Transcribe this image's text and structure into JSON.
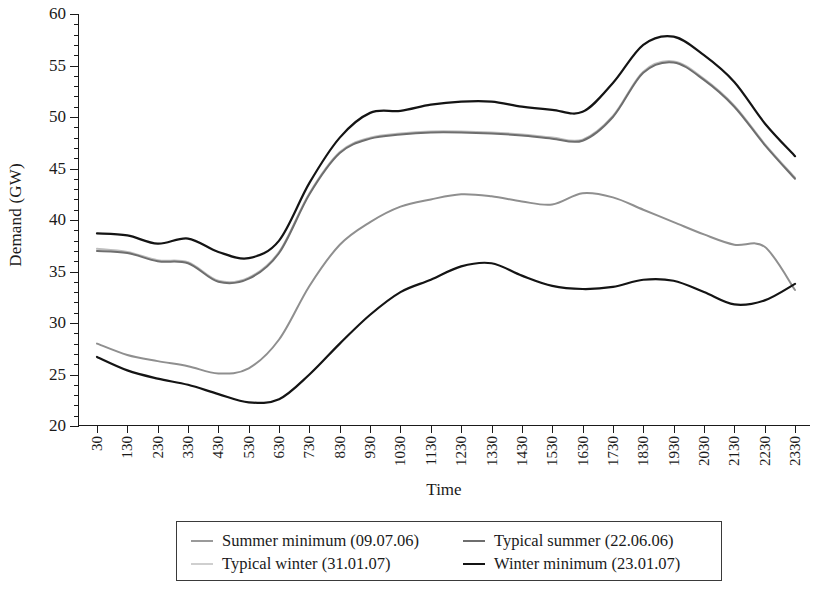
{
  "chart_data": {
    "type": "line",
    "title": "",
    "xlabel": "Time",
    "ylabel": "Demand (GW)",
    "ylim": [
      20,
      60
    ],
    "ytick_step": 5,
    "yminor_step": 1,
    "grid": false,
    "legend_position": "bottom",
    "yticks": [
      20,
      25,
      30,
      35,
      40,
      45,
      50,
      55,
      60
    ],
    "categories": [
      "30",
      "130",
      "230",
      "330",
      "430",
      "530",
      "630",
      "730",
      "830",
      "930",
      "1030",
      "1130",
      "1230",
      "1330",
      "1430",
      "1530",
      "1630",
      "1730",
      "1830",
      "1930",
      "2030",
      "2130",
      "2230",
      "2330"
    ],
    "series": [
      {
        "name": "Summer minimum (09.07.06)",
        "color": "#9a9a9a",
        "width": 2.0,
        "values": [
          28.0,
          26.9,
          26.3,
          25.8,
          25.1,
          25.6,
          28.4,
          33.6,
          37.6,
          39.8,
          41.3,
          42.0,
          42.5,
          42.3,
          41.8,
          41.5,
          42.6,
          42.2,
          41.0,
          39.8,
          38.6,
          37.6,
          37.4,
          33.2
        ]
      },
      {
        "name": "Typical summer (22.06.06)",
        "color": "#6e6e6e",
        "width": 2.0,
        "values": [
          37.0,
          36.8,
          36.0,
          35.8,
          34.0,
          34.3,
          36.8,
          42.5,
          46.5,
          47.9,
          48.3,
          48.5,
          48.5,
          48.4,
          48.2,
          47.9,
          47.7,
          50.0,
          54.3,
          55.3,
          53.6,
          51.0,
          47.3,
          44.0
        ]
      },
      {
        "name": "Typical winter (31.01.07)",
        "color": "#bdbdbd",
        "width": 2.0,
        "values": [
          37.2,
          36.9,
          36.1,
          35.9,
          34.1,
          34.4,
          36.9,
          42.6,
          46.6,
          48.0,
          48.4,
          48.6,
          48.6,
          48.5,
          48.3,
          48.0,
          47.8,
          50.1,
          54.4,
          55.4,
          53.7,
          51.1,
          47.4,
          44.1
        ]
      },
      {
        "name": "Winter minimum (23.01.07)",
        "color": "#141414",
        "width": 2.2,
        "values": [
          26.7,
          25.4,
          24.6,
          24.0,
          23.1,
          22.3,
          22.6,
          25.0,
          28.0,
          30.8,
          33.0,
          34.2,
          35.5,
          35.8,
          34.6,
          33.6,
          33.3,
          33.5,
          34.2,
          34.1,
          33.0,
          31.8,
          32.2,
          33.8
        ]
      }
    ],
    "upper_black": {
      "name": "winter-minimum-upper-trace",
      "color": "#141414",
      "width": 2.2,
      "values": [
        38.7,
        38.5,
        37.7,
        38.2,
        36.9,
        36.3,
        38.0,
        43.6,
        48.0,
        50.4,
        50.6,
        51.2,
        51.5,
        51.5,
        51.0,
        50.7,
        50.5,
        53.3,
        57.0,
        57.8,
        56.0,
        53.4,
        49.4,
        46.2
      ]
    },
    "lower_gray": {
      "name": "summer-minimum-lower-trace",
      "color": "#8f8f8f",
      "width": 2.0,
      "values": [
        28.0,
        26.9,
        26.3,
        25.8,
        25.1,
        25.6,
        28.4,
        33.6,
        37.6,
        39.8,
        41.3,
        42.0,
        42.5,
        42.3,
        41.8,
        41.5,
        42.6,
        42.2,
        41.0,
        39.8,
        38.6,
        37.6,
        37.4,
        33.2
      ]
    }
  },
  "axis": {
    "y_title": "Demand (GW)",
    "x_title": "Time"
  },
  "legend": {
    "entries": [
      {
        "label": "Summer minimum (09.07.06)",
        "color": "#9a9a9a",
        "thickness": "2px"
      },
      {
        "label": "Typical summer (22.06.06)",
        "color": "#6e6e6e",
        "thickness": "2px"
      },
      {
        "label": "Typical winter (31.01.07)",
        "color": "#cfcfcf",
        "thickness": "2px"
      },
      {
        "label": "Winter minimum (23.01.07)",
        "color": "#141414",
        "thickness": "2.6px"
      }
    ]
  }
}
